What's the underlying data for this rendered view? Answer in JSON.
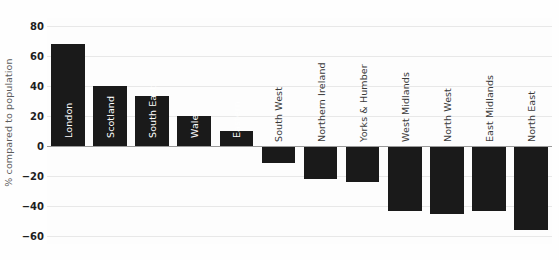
{
  "chart_data": {
    "type": "bar",
    "title": "",
    "xlabel": "",
    "ylabel": "% compared to population",
    "ylim": [
      -65,
      85
    ],
    "yticks": [
      80,
      60,
      40,
      20,
      0,
      -20,
      -40,
      -60
    ],
    "ytick_labels": [
      "80",
      "60",
      "40",
      "20",
      "0",
      "−20",
      "−40",
      "−60"
    ],
    "grid": true,
    "legend": "none",
    "bar_color": "#1a1a1a",
    "categories": [
      "London",
      "Scotland",
      "South East",
      "Wales",
      "Eastern",
      "South West",
      "Northern Ireland",
      "Yorks & Humber",
      "West Midlands",
      "North West",
      "East Midlands",
      "North East"
    ],
    "values": [
      68,
      40,
      33,
      20,
      10,
      -11,
      -22,
      -24,
      -43,
      -45,
      -43,
      -56
    ]
  }
}
